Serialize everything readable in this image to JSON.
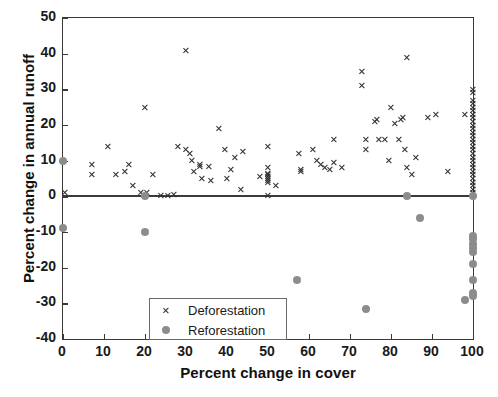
{
  "chart": {
    "type": "scatter",
    "title": "",
    "xlabel": "Percent change in cover",
    "ylabel": "Percent change in annual runoff",
    "xlim": [
      0,
      100
    ],
    "ylim": [
      -40,
      50
    ],
    "xticks": [
      "0",
      "10",
      "20",
      "30",
      "40",
      "50",
      "60",
      "70",
      "80",
      "90",
      "100"
    ],
    "yticks": [
      "50",
      "40",
      "30",
      "20",
      "10",
      "0",
      "-10",
      "-20",
      "-30",
      "-40"
    ],
    "grid": false,
    "legend_position": "lower-left-inside",
    "zero_reference_line": 0,
    "colors": {
      "deforestation_marker": "#2e2e2e",
      "reforestation_marker": "#8c8c8c",
      "axis": "#3a3a3a",
      "text": "#111111",
      "background": "#ffffff"
    },
    "legend": [
      {
        "label": "Deforestation",
        "marker": "x",
        "color": "#2e2e2e"
      },
      {
        "label": "Reforestation",
        "marker": "circle",
        "color": "#8c8c8c"
      }
    ],
    "series": [
      {
        "name": "Deforestation",
        "marker": "x",
        "color": "#2e2e2e",
        "points": [
          [
            0.5,
            1.0
          ],
          [
            7.0,
            9.0
          ],
          [
            7.0,
            6.0
          ],
          [
            11.0,
            14.0
          ],
          [
            13.0,
            6.0
          ],
          [
            15.0,
            7.0
          ],
          [
            16.0,
            9.0
          ],
          [
            17.0,
            3.0
          ],
          [
            19.0,
            1.0
          ],
          [
            20.5,
            1.0
          ],
          [
            20.0,
            25.0
          ],
          [
            22.0,
            6.0
          ],
          [
            24.0,
            0.2
          ],
          [
            25.5,
            0.2
          ],
          [
            27.0,
            0.5
          ],
          [
            28.0,
            14.0
          ],
          [
            30.0,
            41.0
          ],
          [
            30.0,
            13.0
          ],
          [
            31.0,
            12.0
          ],
          [
            31.5,
            10.0
          ],
          [
            32.0,
            7.0
          ],
          [
            33.5,
            8.5
          ],
          [
            33.5,
            9.0
          ],
          [
            34.0,
            5.0
          ],
          [
            35.5,
            8.5
          ],
          [
            36.0,
            4.5
          ],
          [
            38.0,
            19.0
          ],
          [
            39.5,
            13.0
          ],
          [
            40.0,
            5.0
          ],
          [
            41.0,
            7.5
          ],
          [
            42.0,
            11.0
          ],
          [
            43.5,
            2.0
          ],
          [
            44.0,
            12.5
          ],
          [
            48.0,
            5.5
          ],
          [
            50.0,
            14.0
          ],
          [
            50.0,
            8.0
          ],
          [
            50.0,
            6.5
          ],
          [
            50.0,
            6.0
          ],
          [
            50.0,
            5.5
          ],
          [
            50.0,
            5.0
          ],
          [
            50.0,
            4.5
          ],
          [
            50.0,
            4.0
          ],
          [
            50.0,
            0.2
          ],
          [
            52.0,
            3.0
          ],
          [
            57.5,
            12.0
          ],
          [
            58.0,
            7.5
          ],
          [
            58.0,
            7.0
          ],
          [
            61.0,
            13.0
          ],
          [
            62.0,
            10.0
          ],
          [
            63.0,
            9.0
          ],
          [
            64.0,
            8.0
          ],
          [
            65.0,
            7.5
          ],
          [
            66.0,
            9.5
          ],
          [
            66.0,
            16.0
          ],
          [
            68.0,
            8.0
          ],
          [
            73.0,
            35.0
          ],
          [
            73.0,
            31.0
          ],
          [
            74.0,
            16.0
          ],
          [
            74.0,
            13.0
          ],
          [
            76.0,
            21.0
          ],
          [
            76.5,
            21.5
          ],
          [
            77.0,
            16.0
          ],
          [
            78.5,
            16.0
          ],
          [
            79.5,
            10.0
          ],
          [
            80.0,
            25.0
          ],
          [
            81.0,
            20.5
          ],
          [
            82.0,
            16.0
          ],
          [
            82.5,
            21.5
          ],
          [
            83.0,
            22.0
          ],
          [
            83.5,
            13.0
          ],
          [
            84.0,
            39.0
          ],
          [
            84.0,
            8.0
          ],
          [
            85.0,
            6.0
          ],
          [
            86.0,
            11.0
          ],
          [
            89.0,
            22.0
          ],
          [
            91.0,
            23.0
          ],
          [
            94.0,
            7.0
          ],
          [
            98.0,
            23.0
          ],
          [
            100.0,
            30.0
          ],
          [
            100.0,
            29.0
          ],
          [
            100.0,
            27.0
          ],
          [
            100.0,
            26.0
          ],
          [
            100.0,
            25.0
          ],
          [
            100.0,
            24.0
          ],
          [
            100.0,
            23.0
          ],
          [
            100.0,
            22.0
          ],
          [
            100.0,
            21.0
          ],
          [
            100.0,
            20.0
          ],
          [
            100.0,
            19.0
          ],
          [
            100.0,
            18.0
          ],
          [
            100.0,
            17.0
          ],
          [
            100.0,
            16.0
          ],
          [
            100.0,
            15.0
          ],
          [
            100.0,
            14.0
          ],
          [
            100.0,
            13.0
          ],
          [
            100.0,
            12.0
          ],
          [
            100.0,
            11.0
          ],
          [
            100.0,
            10.0
          ],
          [
            100.0,
            9.0
          ],
          [
            100.0,
            8.0
          ],
          [
            100.0,
            7.0
          ],
          [
            100.0,
            6.0
          ],
          [
            100.0,
            5.0
          ],
          [
            100.0,
            4.0
          ],
          [
            100.0,
            3.0
          ],
          [
            100.0,
            2.0
          ],
          [
            100.0,
            1.0
          ],
          [
            100.0,
            0.3
          ]
        ]
      },
      {
        "name": "Reforestation",
        "marker": "circle",
        "color": "#8c8c8c",
        "points": [
          [
            0.0,
            10.0
          ],
          [
            0.0,
            -9.0
          ],
          [
            20.0,
            0.0
          ],
          [
            20.0,
            -10.0
          ],
          [
            57.0,
            -23.5
          ],
          [
            74.0,
            -31.5
          ],
          [
            84.0,
            0.0
          ],
          [
            87.0,
            -6.0
          ],
          [
            98.0,
            -29.0
          ],
          [
            100.0,
            0.0
          ],
          [
            100.0,
            -11.0
          ],
          [
            100.0,
            -12.0
          ],
          [
            100.0,
            -13.5
          ],
          [
            100.0,
            -14.5
          ],
          [
            100.0,
            -15.5
          ],
          [
            100.0,
            -19.0
          ],
          [
            100.0,
            -23.5
          ],
          [
            100.0,
            -27.0
          ],
          [
            100.0,
            -28.0
          ]
        ]
      }
    ]
  }
}
